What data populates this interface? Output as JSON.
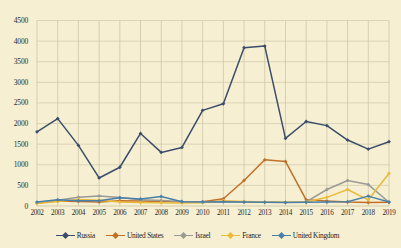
{
  "chart_data": {
    "type": "line",
    "title": "",
    "xlabel": "",
    "ylabel": "",
    "ylim": [
      0,
      4500
    ],
    "ytick_step": 500,
    "grid": true,
    "legend_position": "bottom",
    "categories": [
      "2002",
      "2003",
      "2004",
      "2005",
      "2006",
      "2007",
      "2008",
      "2009",
      "2010",
      "2011",
      "2012",
      "2013",
      "2014",
      "2015",
      "2016",
      "2017",
      "2018",
      "2019"
    ],
    "yticks": [
      "0",
      "500",
      "1000",
      "1500",
      "2000",
      "2500",
      "3000",
      "3500",
      "4000",
      "4500"
    ],
    "series": [
      {
        "name": "Russia",
        "color": "#3b4d6b",
        "values": [
          1800,
          2120,
          1470,
          680,
          940,
          1760,
          1300,
          1420,
          2320,
          2480,
          3840,
          3880,
          1640,
          2050,
          1950,
          1600,
          1380,
          1560
        ]
      },
      {
        "name": "United States",
        "color": "#c1702a",
        "values": [
          70,
          120,
          110,
          95,
          130,
          120,
          110,
          100,
          105,
          175,
          620,
          1120,
          1080,
          150,
          120,
          95,
          85,
          90
        ]
      },
      {
        "name": "Israel",
        "color": "#9a9a96",
        "values": [
          80,
          140,
          215,
          245,
          205,
          150,
          135,
          110,
          105,
          110,
          100,
          95,
          90,
          100,
          400,
          620,
          520,
          90
        ]
      },
      {
        "name": "France",
        "color": "#e8bb3c",
        "values": [
          60,
          110,
          160,
          140,
          95,
          85,
          80,
          75,
          80,
          130,
          110,
          95,
          90,
          95,
          210,
          400,
          150,
          790
        ]
      },
      {
        "name": "United Kingdom",
        "color": "#4a7fa8",
        "values": [
          95,
          150,
          130,
          125,
          200,
          170,
          230,
          105,
          100,
          105,
          95,
          90,
          85,
          90,
          95,
          105,
          240,
          95
        ]
      }
    ]
  },
  "legend": {
    "items": [
      {
        "label": "Russia"
      },
      {
        "label": "United States"
      },
      {
        "label": "Israel"
      },
      {
        "label": "France"
      },
      {
        "label": "United Kingdom"
      }
    ]
  }
}
